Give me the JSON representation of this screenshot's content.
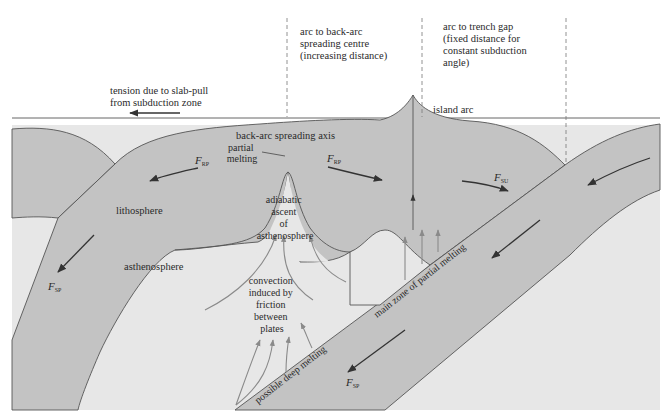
{
  "diagram": {
    "type": "geological cross-section",
    "colors": {
      "lithosphere": "#c3c3c3",
      "asthenosphere": "#e7e7e7",
      "background": "#ffffff",
      "outline": "#555555",
      "force_arrow": "#333333",
      "convection_arrow": "#8a8a8a"
    }
  },
  "labels": {
    "tension_line1": "tension due to slab-pull",
    "tension_line2": "from subduction zone",
    "arc_backarc_line1": "arc to back-arc",
    "arc_backarc_line2": "spreading centre",
    "arc_backarc_line3": "(increasing distance)",
    "arc_trench_line1": "arc to trench gap",
    "arc_trench_line2": "(fixed distance for",
    "arc_trench_line3": "constant subduction",
    "arc_trench_line4": "angle)",
    "island_arc": "island arc",
    "spreading_axis": "back-arc spreading axis",
    "partial_melting_line1": "partial",
    "partial_melting_line2": "melting",
    "lithosphere": "lithosphere",
    "asthenosphere": "asthenosphere",
    "adiabatic_line1": "adiabatic",
    "adiabatic_line2": "ascent",
    "adiabatic_line3": "of",
    "adiabatic_line4": "asthenosphere",
    "convection_line1": "convection",
    "convection_line2": "induced by",
    "convection_line3": "friction",
    "convection_line4": "between",
    "convection_line5": "plates",
    "deep_melting": "possible deep melting",
    "main_melting": "main zone of partial melting"
  },
  "forces": {
    "f_rp_left": {
      "symbol": "F",
      "subscript": "RP"
    },
    "f_rp_right": {
      "symbol": "F",
      "subscript": "RP"
    },
    "f_su": {
      "symbol": "F",
      "subscript": "SU"
    },
    "f_sp_left": {
      "symbol": "F",
      "subscript": "SP"
    },
    "f_sp_right": {
      "symbol": "F",
      "subscript": "SP"
    }
  }
}
